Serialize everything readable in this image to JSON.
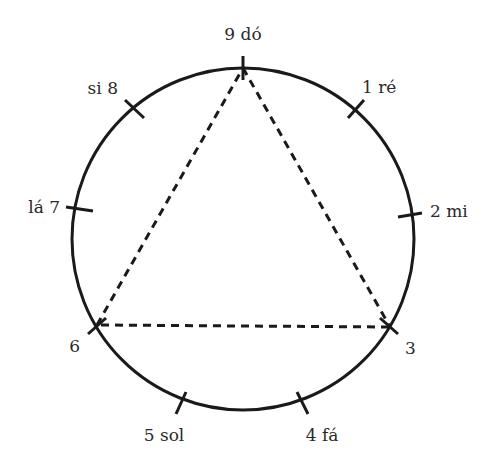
{
  "diagram": {
    "type": "enneagram-like circle of nine notes",
    "colors": {
      "stroke": "#1a1a1a",
      "text": "#2a2a2a",
      "background": "#ffffff"
    },
    "circle": {
      "cx": 243,
      "cy": 239,
      "r": 171
    },
    "points": [
      {
        "number": "9",
        "note": "dó",
        "label": "9 dó",
        "angle_deg": 0
      },
      {
        "number": "1",
        "note": "ré",
        "label": "1 ré",
        "angle_deg": 40
      },
      {
        "number": "2",
        "note": "mi",
        "label": "2 mi",
        "angle_deg": 80
      },
      {
        "number": "3",
        "note": "",
        "label": "3",
        "angle_deg": 120
      },
      {
        "number": "4",
        "note": "fá",
        "label": "4 fá",
        "angle_deg": 160
      },
      {
        "number": "5",
        "note": "sol",
        "label": "5 sol",
        "angle_deg": 200
      },
      {
        "number": "6",
        "note": "",
        "label": "6",
        "angle_deg": 240
      },
      {
        "number": "7",
        "note": "lá",
        "label": "lá 7",
        "angle_deg": 280
      },
      {
        "number": "8",
        "note": "si",
        "label": "si 8",
        "angle_deg": 320
      }
    ],
    "triangle": {
      "vertices": [
        "9",
        "3",
        "6"
      ],
      "style": "dashed"
    }
  }
}
